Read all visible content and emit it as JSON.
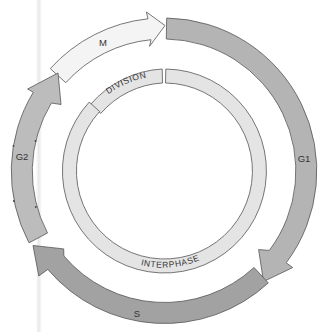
{
  "diagram": {
    "type": "cell-cycle",
    "outer_phases": [
      {
        "id": "M",
        "label": "M",
        "fill": "#f4f4f4",
        "start_deg": 312,
        "end_deg": 0,
        "head_deg": 359
      },
      {
        "id": "G1",
        "label": "G1",
        "fill": "#b4b4b4",
        "start_deg": 1,
        "end_deg": 127,
        "head_deg": 135
      },
      {
        "id": "S",
        "label": "S",
        "fill": "#a2a2a2",
        "start_deg": 137,
        "end_deg": 230,
        "head_deg": 238
      },
      {
        "id": "G2",
        "label": "G2",
        "fill": "#bcbcbc",
        "start_deg": 242,
        "end_deg": 301,
        "head_deg": 309
      }
    ],
    "inner_ring": [
      {
        "id": "division",
        "label": "DIVISION",
        "fill": "#e4e4e4",
        "start_deg": 314,
        "end_deg": 359
      },
      {
        "id": "interphase",
        "label": "INTERPHASE",
        "fill": "#e4e4e4",
        "start_deg": 1,
        "end_deg": 312
      }
    ],
    "colors": {
      "outline": "#555555",
      "text": "#333333",
      "background": "#ffffff"
    }
  }
}
